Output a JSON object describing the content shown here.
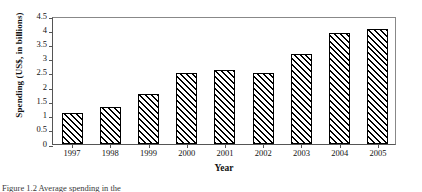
{
  "figure": {
    "caption_partial": "Figure 1.2  Average spending in the",
    "xaxis_title": "Year",
    "yaxis_title": "Spending (US$, in billions)"
  },
  "chart_data": {
    "type": "bar",
    "title": "",
    "xlabel": "Year",
    "ylabel": "Spending (US$, in billions)",
    "categories": [
      "1997",
      "1998",
      "1999",
      "2000",
      "2001",
      "2002",
      "2003",
      "2004",
      "2005"
    ],
    "values": [
      1.1,
      1.3,
      1.75,
      2.5,
      2.6,
      2.5,
      3.15,
      3.9,
      4.05
    ],
    "ylim": [
      0,
      4.5
    ],
    "ytick_labels": [
      "0",
      "0.5",
      "1",
      "1.5",
      "2",
      "2.5",
      "3",
      "3.5",
      "4",
      "4.5"
    ],
    "ytick_values": [
      0,
      0.5,
      1,
      1.5,
      2,
      2.5,
      3,
      3.5,
      4,
      4.5
    ],
    "grid": false,
    "legend": false,
    "bar_fill": "diagonal-hatch",
    "bar_color": "#000000",
    "bar_background": "#ffffff"
  }
}
